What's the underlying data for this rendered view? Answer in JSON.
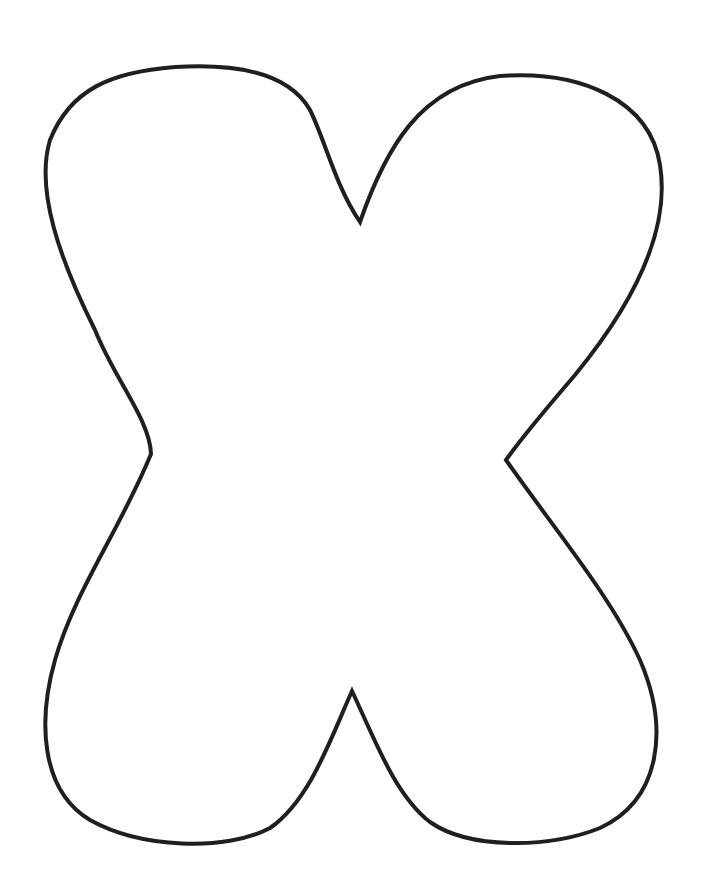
{
  "figure": {
    "letter": "X",
    "stroke_color": "#1f1f1f",
    "fill_color": "#ffffff",
    "background": "#ffffff"
  }
}
